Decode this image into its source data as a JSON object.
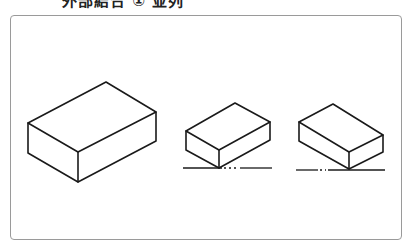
{
  "heading": {
    "prefix": "⋯",
    "text": "外部結合 ①  並列",
    "clipped": true
  },
  "figure": {
    "frame_color": "#9a9a9a",
    "stroke_color": "#1a1a1a",
    "boxes": [
      {
        "name": "large-box",
        "points": {
          "top": [
            106,
            82
          ],
          "left": [
            28,
            123
          ],
          "right": [
            156,
            112
          ],
          "front_top": [
            78,
            152
          ],
          "front_bottom": [
            78,
            182
          ],
          "left_bottom": [
            28,
            153
          ],
          "right_bottom": [
            156,
            141
          ]
        },
        "has_centerline": false
      },
      {
        "name": "middle-box",
        "points": {
          "top": [
            235,
            103
          ],
          "left": [
            186,
            131
          ],
          "right": [
            270,
            122
          ],
          "front_top": [
            219,
            150
          ],
          "front_bottom": [
            219,
            168
          ],
          "left_bottom": [
            186,
            150
          ],
          "right_bottom": [
            270,
            140
          ]
        },
        "has_centerline": true,
        "centerline": {
          "y": 168,
          "x1": 183,
          "x2": 272,
          "gap": [
            222,
            240
          ]
        }
      },
      {
        "name": "right-box",
        "points": {
          "top": [
            333,
            104
          ],
          "left": [
            299,
            122
          ],
          "right": [
            383,
            135
          ],
          "front_top": [
            349,
            152
          ],
          "front_bottom": [
            349,
            169
          ],
          "left_bottom": [
            299,
            141
          ],
          "right_bottom": [
            383,
            152
          ]
        },
        "has_centerline": true,
        "centerline": {
          "y": 170,
          "x1": 296,
          "x2": 385,
          "gap": [
            318,
            328
          ]
        }
      }
    ]
  }
}
